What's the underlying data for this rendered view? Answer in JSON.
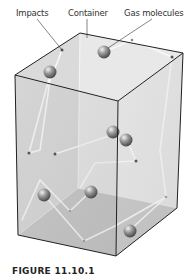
{
  "labels": {
    "impacts": "Impacts",
    "container": "Container",
    "gas_molecules": "Gas molecules"
  },
  "caption": "FIGURE 11.10.1",
  "colors": {
    "box_edge": "#222222",
    "box_face_front": "#c8c8c8",
    "box_face_side": "#d6d6d6",
    "box_face_top": "#e4e4e4",
    "path": "#ffffff",
    "molecule": "#8a8a8a",
    "impact_dot": "#111111"
  }
}
